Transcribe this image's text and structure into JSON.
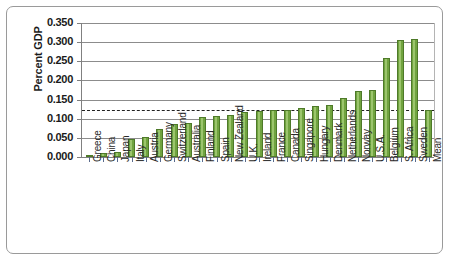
{
  "chart_data": {
    "type": "bar",
    "title": "",
    "xlabel": "",
    "ylabel": "Percent GDP",
    "ylim": [
      0.0,
      0.35
    ],
    "ytick_labels": [
      "0.350",
      "0.300",
      "0.250",
      "0.200",
      "0.150",
      "0.100",
      "0.050",
      "0.000"
    ],
    "ytick_values": [
      0.35,
      0.3,
      0.25,
      0.2,
      0.15,
      0.1,
      0.05,
      0.0
    ],
    "grid": true,
    "legend": "none",
    "categories": [
      "Greece",
      "China",
      "Japan",
      "Italy",
      "Austria",
      "Germany",
      "Switzerland",
      "Australia",
      "Finland",
      "Spain",
      "New Zealand",
      "U.K.",
      "Ireland",
      "France",
      "Canada",
      "Singapore",
      "Hungary",
      "Denmark",
      "Netherlands",
      "Norway",
      "U.S.A.",
      "Belgium",
      "S. Africa",
      "Sweden",
      "Mean"
    ],
    "values": [
      0.002,
      0.01,
      0.013,
      0.048,
      0.052,
      0.072,
      0.085,
      0.088,
      0.105,
      0.107,
      0.11,
      0.118,
      0.119,
      0.123,
      0.124,
      0.128,
      0.132,
      0.136,
      0.155,
      0.172,
      0.174,
      0.258,
      0.305,
      0.307,
      0.124
    ],
    "annotations": [
      {
        "name": "mean-reference-line",
        "style": "dashed",
        "value": 0.124
      }
    ],
    "colors": {
      "bar_fill": "#70a33f",
      "bar_border": "#4e7a29",
      "bar_highlight": "#9cc56d",
      "gridline": "#8c8c8c",
      "axis": "#808080",
      "mean_line": "#222222",
      "text": "#1a1a1a",
      "background": "#ffffff",
      "frame_border": "#9a9a9a"
    }
  }
}
